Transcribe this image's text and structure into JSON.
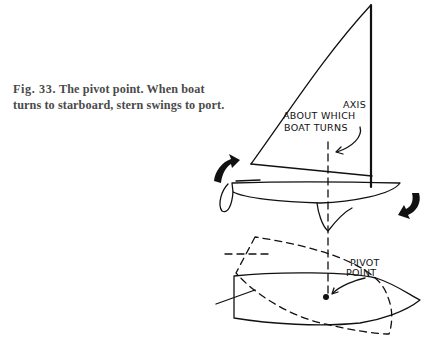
{
  "figure": {
    "number": "Fig. 33.",
    "caption": "The pivot point. When boat turns to starboard, stern swings to port.",
    "labels": {
      "axis": [
        "AXIS",
        "ABOUT WHICH",
        "BOAT TURNS"
      ],
      "pivot": [
        "PIVOT",
        "POINT"
      ]
    },
    "icons": [
      "turn-arrow-left",
      "turn-arrow-right"
    ]
  }
}
